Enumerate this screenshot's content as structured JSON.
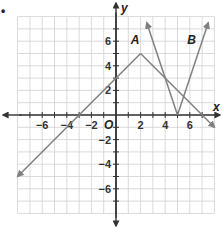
{
  "problem_marker": "•",
  "chart_data": {
    "type": "line",
    "title": "",
    "xlabel": "x",
    "ylabel": "y",
    "origin_label": "O",
    "xlim": [
      -8,
      8
    ],
    "ylim": [
      -8,
      8
    ],
    "grid": true,
    "x_ticks": [
      -6,
      -4,
      -2,
      2,
      4,
      6
    ],
    "y_ticks": [
      6,
      4,
      2,
      -2,
      -4,
      -6
    ],
    "x_tick_labels": [
      "−6",
      "−4",
      "−2",
      "2",
      "4",
      "6"
    ],
    "y_tick_labels": [
      "6",
      "4",
      "2",
      "−2",
      "−4",
      "−6"
    ],
    "colors": {
      "grid": "#d0d0d0",
      "axis": "#333333",
      "series": "#808080"
    },
    "series": [
      {
        "name": "A",
        "equation": "y = -|x - 2| + 5",
        "points": [
          [
            -8,
            -5
          ],
          [
            2,
            5
          ],
          [
            8,
            -1
          ]
        ],
        "label_at": [
          1.2,
          5.8
        ]
      },
      {
        "name": "B",
        "equation": "y = 3|x - 5|",
        "points": [
          [
            2.5,
            7.5
          ],
          [
            5,
            0
          ],
          [
            7.5,
            7.5
          ]
        ],
        "label_at": [
          5.8,
          5.8
        ]
      }
    ]
  }
}
